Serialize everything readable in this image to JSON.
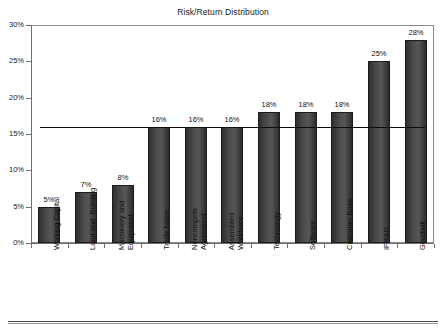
{
  "chart_data": {
    "type": "bar",
    "title": "Risk/Return Distribution",
    "xlabel": "",
    "ylabel": "",
    "ylim": [
      0,
      30
    ],
    "ytick_labels": [
      "0%",
      "5%",
      "10%",
      "15%",
      "20%",
      "25%",
      "30%"
    ],
    "ytick_values": [
      0,
      5,
      10,
      15,
      20,
      25,
      30
    ],
    "grid": false,
    "legend": "none",
    "categories": [
      "Working Capital",
      "Land and  Building",
      "Machinery and\nEquipment",
      "Trade Name",
      "Noncompete\nAgreement",
      "Assembled\nWorkforce",
      "Technology",
      "Software",
      "Customer Base",
      "IPR&D",
      "Goodwill"
    ],
    "values": [
      5,
      7,
      8,
      16,
      16,
      16,
      18,
      18,
      18,
      25,
      28
    ],
    "data_labels": [
      "5%",
      "7%",
      "8%",
      "16%",
      "16%",
      "16%",
      "18%",
      "18%",
      "18%",
      "25%",
      "28%"
    ],
    "reference_line": {
      "name": "weighted-average-return",
      "value": 16,
      "label": ""
    },
    "bar_color": "#3f3f3f",
    "axis_color": "#6f6f6f",
    "reference_line_color": "#0d0d0d"
  }
}
